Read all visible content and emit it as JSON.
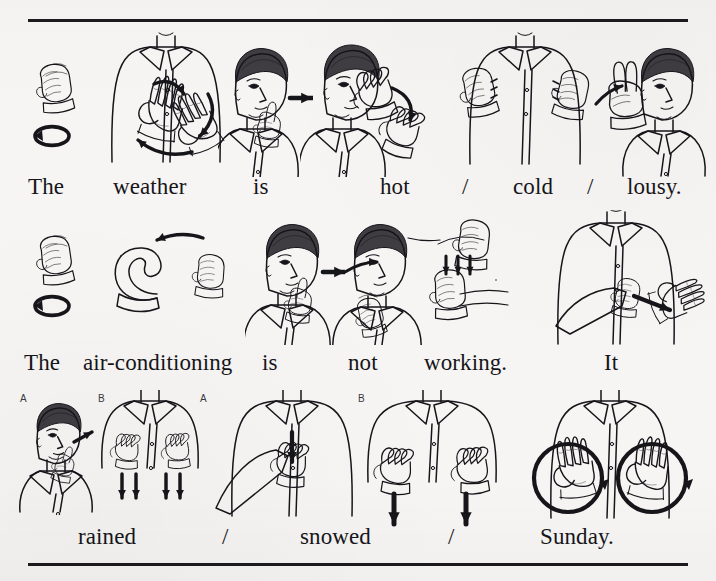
{
  "page": {
    "background_color": "#f6f5f3",
    "ink_color": "#16151a",
    "rule_color": "#1b1a1f"
  },
  "rules": {
    "top_label": "top-horizontal-rule",
    "bottom_label": "bottom-horizontal-rule"
  },
  "rows": [
    {
      "id": "row-weather",
      "sentence": "The weather is hot / cold / lousy.",
      "words": [
        {
          "text": "The",
          "x": 28,
          "type": "word"
        },
        {
          "text": "weather",
          "x": 113,
          "type": "word"
        },
        {
          "text": "is",
          "x": 253,
          "type": "word"
        },
        {
          "text": "hot",
          "x": 380,
          "type": "word"
        },
        {
          "text": "/",
          "x": 462,
          "type": "slash"
        },
        {
          "text": "cold",
          "x": 513,
          "type": "word"
        },
        {
          "text": "/",
          "x": 587,
          "type": "slash"
        },
        {
          "text": "lousy.",
          "x": 627,
          "type": "word"
        }
      ],
      "figures": [
        {
          "name": "sign-the-letter-t-twist",
          "label": "The",
          "x": 18,
          "w": 70,
          "h": 140
        },
        {
          "name": "sign-weather-w-hands-rotate",
          "label": "weather",
          "x": 88,
          "w": 150,
          "h": 150
        },
        {
          "name": "sign-is-i-hand-at-chin",
          "label": "is",
          "x": 218,
          "w": 95,
          "h": 145
        },
        {
          "name": "sign-hot-claw-from-mouth",
          "label": "hot",
          "x": 300,
          "w": 160,
          "h": 145
        },
        {
          "name": "sign-cold-fists-shiver",
          "label": "cold",
          "x": 455,
          "w": 140,
          "h": 145
        },
        {
          "name": "sign-lousy-thumb-from-nose",
          "label": "lousy",
          "x": 580,
          "w": 130,
          "h": 145
        }
      ]
    },
    {
      "id": "row-air-conditioning",
      "sentence": "The air-conditioning is not working. It",
      "words": [
        {
          "text": "The",
          "x": 24,
          "type": "word"
        },
        {
          "text": "air-conditioning",
          "x": 83,
          "type": "word"
        },
        {
          "text": "is",
          "x": 262,
          "type": "word"
        },
        {
          "text": "not",
          "x": 348,
          "type": "word"
        },
        {
          "text": "working.",
          "x": 424,
          "type": "word"
        },
        {
          "text": "It",
          "x": 604,
          "type": "word"
        }
      ],
      "figures": [
        {
          "name": "sign-the-letter-t-twist-2",
          "label": "The",
          "x": 18,
          "w": 70,
          "h": 130
        },
        {
          "name": "sign-air-conditioning-a-c-hands",
          "label": "air-conditioning",
          "x": 95,
          "w": 160,
          "h": 120
        },
        {
          "name": "sign-is-i-hand-at-chin-2",
          "label": "is",
          "x": 245,
          "w": 100,
          "h": 135
        },
        {
          "name": "sign-not-thumb-under-chin",
          "label": "not",
          "x": 325,
          "w": 110,
          "h": 135
        },
        {
          "name": "sign-working-fists-tapping",
          "label": "working",
          "x": 400,
          "w": 135,
          "h": 120
        },
        {
          "name": "sign-it-index-to-palm",
          "label": "It",
          "x": 530,
          "w": 180,
          "h": 140
        }
      ]
    },
    {
      "id": "row-rained-snowed-sunday",
      "sentence": "rained / snowed / Sunday.",
      "words": [
        {
          "text": "rained",
          "x": 78,
          "type": "word"
        },
        {
          "text": "/",
          "x": 222,
          "type": "slash"
        },
        {
          "text": "snowed",
          "x": 300,
          "type": "word"
        },
        {
          "text": "/",
          "x": 448,
          "type": "slash"
        },
        {
          "text": "Sunday.",
          "x": 540,
          "type": "word"
        }
      ],
      "sublabels": [
        {
          "text": "A",
          "x": 20,
          "y": 393,
          "for": "rained-step-a"
        },
        {
          "text": "B",
          "x": 98,
          "y": 393,
          "for": "rained-step-b"
        },
        {
          "text": "A",
          "x": 200,
          "y": 393,
          "for": "snowed-step-a"
        },
        {
          "text": "B",
          "x": 358,
          "y": 393,
          "for": "snowed-step-b"
        }
      ],
      "figures": [
        {
          "name": "sign-rained-step-a-rain-at-mouth",
          "label": "rained A",
          "x": 18,
          "w": 82,
          "h": 125
        },
        {
          "name": "sign-rained-step-b-hands-fall",
          "label": "rained B",
          "x": 96,
          "w": 110,
          "h": 125
        },
        {
          "name": "sign-snowed-step-a-white-chest",
          "label": "snowed A",
          "x": 196,
          "w": 160,
          "h": 130
        },
        {
          "name": "sign-snowed-step-b-hands-flutter",
          "label": "snowed B",
          "x": 352,
          "w": 160,
          "h": 140
        },
        {
          "name": "sign-sunday-palms-circling",
          "label": "Sunday",
          "x": 510,
          "w": 200,
          "h": 135
        }
      ]
    }
  ]
}
